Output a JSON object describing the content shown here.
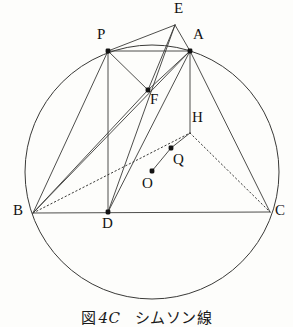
{
  "figure": {
    "caption": {
      "prefix": "図",
      "number": "4C",
      "text": "シムソン線"
    },
    "stroke_color": "#3a3a38",
    "label_color": "#121212",
    "background_color": "#fdfdfb",
    "circle": {
      "name": "circumcircle",
      "cx": 152,
      "cy": 172,
      "r": 127
    },
    "points": [
      {
        "id": "P",
        "label": "P",
        "x": 108,
        "y": 51,
        "dot": true,
        "lx": 97,
        "ly": 27
      },
      {
        "id": "A",
        "label": "A",
        "x": 190,
        "y": 51,
        "dot": true,
        "lx": 193,
        "ly": 27
      },
      {
        "id": "E",
        "label": "E",
        "x": 175,
        "y": 25,
        "dot": false,
        "lx": 174,
        "ly": 1
      },
      {
        "id": "F",
        "label": "F",
        "x": 148,
        "y": 90,
        "dot": true,
        "lx": 150,
        "ly": 92
      },
      {
        "id": "H",
        "label": "H",
        "x": 190,
        "y": 133,
        "dot": false,
        "lx": 192,
        "ly": 110
      },
      {
        "id": "Q",
        "label": "Q",
        "x": 171,
        "y": 148,
        "dot": true,
        "lx": 173,
        "ly": 152
      },
      {
        "id": "O",
        "label": "O",
        "x": 152,
        "y": 171,
        "dot": true,
        "lx": 142,
        "ly": 176
      },
      {
        "id": "B",
        "label": "B",
        "x": 33,
        "y": 213,
        "dot": false,
        "lx": 13,
        "ly": 203
      },
      {
        "id": "D",
        "label": "D",
        "x": 108,
        "y": 212,
        "dot": true,
        "lx": 102,
        "ly": 216
      },
      {
        "id": "C",
        "label": "C",
        "x": 270,
        "y": 212,
        "dot": false,
        "lx": 275,
        "ly": 203
      }
    ],
    "segments": [
      {
        "name": "segment-B-C",
        "from": "B",
        "to": "C",
        "style": "solid"
      },
      {
        "name": "segment-P-A",
        "from": "P",
        "to": "A",
        "style": "solid"
      },
      {
        "name": "segment-P-E",
        "from": "P",
        "to": "E",
        "style": "solid"
      },
      {
        "name": "segment-E-A",
        "from": "E",
        "to": "A",
        "style": "solid"
      },
      {
        "name": "segment-E-F",
        "from": "E",
        "to": "F",
        "style": "solid"
      },
      {
        "name": "segment-E-D",
        "from": "E",
        "to": "D",
        "style": "solid"
      },
      {
        "name": "segment-P-F",
        "from": "P",
        "to": "F",
        "style": "solid"
      },
      {
        "name": "segment-A-F",
        "from": "A",
        "to": "F",
        "style": "solid"
      },
      {
        "name": "segment-P-D",
        "from": "P",
        "to": "D",
        "style": "solid"
      },
      {
        "name": "segment-P-B",
        "from": "P",
        "to": "B",
        "style": "solid"
      },
      {
        "name": "segment-A-B",
        "from": "A",
        "to": "B",
        "style": "solid"
      },
      {
        "name": "segment-A-D",
        "from": "A",
        "to": "D",
        "style": "solid"
      },
      {
        "name": "segment-A-H",
        "from": "A",
        "to": "H",
        "style": "solid"
      },
      {
        "name": "segment-A-C",
        "from": "A",
        "to": "C",
        "style": "solid"
      },
      {
        "name": "segment-B-F",
        "from": "B",
        "to": "F",
        "style": "solid"
      },
      {
        "name": "segment-B-H",
        "from": "B",
        "to": "H",
        "style": "dotted"
      },
      {
        "name": "segment-H-C",
        "from": "H",
        "to": "C",
        "style": "dotted"
      },
      {
        "name": "segment-O-Q",
        "from": "O",
        "to": "Q",
        "style": "solid"
      },
      {
        "name": "segment-Q-H",
        "from": "Q",
        "to": "H",
        "style": "solid"
      }
    ]
  }
}
